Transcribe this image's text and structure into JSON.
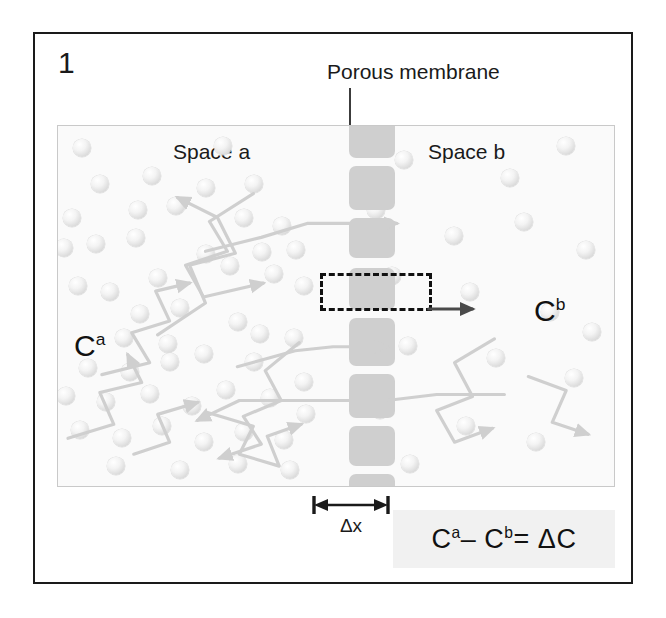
{
  "figure": {
    "panel_number": "1",
    "membrane_caption": "Porous membrane",
    "space_a_label": "Space a",
    "space_b_label": "Space b",
    "concentration_a": "C",
    "concentration_a_sup": "a",
    "concentration_b": "C",
    "concentration_b_sup": "b",
    "delta_x_label": "Δx",
    "equation": {
      "term1": "C",
      "term1_sup": "a",
      "minus": "–",
      "term2": "C",
      "term2_sup": "b",
      "equals": "=",
      "result": "ΔC"
    }
  },
  "colors": {
    "frame": "#1a1a1a",
    "panel_background": "#fafafa",
    "panel_border": "#c9c9c9",
    "membrane_block": "#cfcfcf",
    "particle": "#e4e4e4",
    "arrow_gray": "#cfcfcf",
    "arrow_dark": "#4a4a4a",
    "dashed_box": "#111111",
    "equation_box": "#f1f1f1",
    "text": "#1a1a1a"
  },
  "membrane": {
    "center_x": 291,
    "block_width": 46,
    "blocks": [
      {
        "y": -6,
        "h": 38
      },
      {
        "y": 40,
        "h": 44
      },
      {
        "y": 92,
        "h": 40
      },
      {
        "y": 142,
        "h": 42
      },
      {
        "y": 192,
        "h": 48
      },
      {
        "y": 248,
        "h": 44
      },
      {
        "y": 300,
        "h": 40
      },
      {
        "y": 348,
        "h": 44
      },
      {
        "y": 400,
        "h": 40
      },
      {
        "y": 448,
        "h": 44
      },
      {
        "y": 500,
        "h": 40
      }
    ]
  },
  "particles_a": [
    {
      "x": 24,
      "y": 22,
      "r": 9
    },
    {
      "x": 165,
      "y": 20,
      "r": 9
    },
    {
      "x": 42,
      "y": 58,
      "r": 9
    },
    {
      "x": 94,
      "y": 50,
      "r": 9
    },
    {
      "x": 148,
      "y": 62,
      "r": 9
    },
    {
      "x": 196,
      "y": 58,
      "r": 9
    },
    {
      "x": 14,
      "y": 92,
      "r": 9
    },
    {
      "x": 80,
      "y": 84,
      "r": 9
    },
    {
      "x": 118,
      "y": 80,
      "r": 9
    },
    {
      "x": 186,
      "y": 92,
      "r": 9
    },
    {
      "x": 6,
      "y": 122,
      "r": 9
    },
    {
      "x": 38,
      "y": 118,
      "r": 9
    },
    {
      "x": 78,
      "y": 112,
      "r": 9
    },
    {
      "x": 148,
      "y": 128,
      "r": 9
    },
    {
      "x": 204,
      "y": 126,
      "r": 9
    },
    {
      "x": 224,
      "y": 100,
      "r": 9
    },
    {
      "x": 20,
      "y": 160,
      "r": 9
    },
    {
      "x": 52,
      "y": 166,
      "r": 9
    },
    {
      "x": 100,
      "y": 152,
      "r": 9
    },
    {
      "x": 172,
      "y": 140,
      "r": 9
    },
    {
      "x": 216,
      "y": 148,
      "r": 9
    },
    {
      "x": 238,
      "y": 124,
      "r": 9
    },
    {
      "x": 82,
      "y": 188,
      "r": 9
    },
    {
      "x": 122,
      "y": 182,
      "r": 9
    },
    {
      "x": 180,
      "y": 196,
      "r": 9
    },
    {
      "x": 246,
      "y": 160,
      "r": 9
    },
    {
      "x": 66,
      "y": 212,
      "r": 9
    },
    {
      "x": 110,
      "y": 218,
      "r": 9
    },
    {
      "x": 202,
      "y": 208,
      "r": 9
    },
    {
      "x": 30,
      "y": 242,
      "r": 9
    },
    {
      "x": 72,
      "y": 246,
      "r": 9
    },
    {
      "x": 112,
      "y": 236,
      "r": 9
    },
    {
      "x": 146,
      "y": 228,
      "r": 9
    },
    {
      "x": 196,
      "y": 236,
      "r": 9
    },
    {
      "x": 236,
      "y": 212,
      "r": 9
    },
    {
      "x": 8,
      "y": 270,
      "r": 9
    },
    {
      "x": 48,
      "y": 276,
      "r": 9
    },
    {
      "x": 92,
      "y": 268,
      "r": 9
    },
    {
      "x": 134,
      "y": 280,
      "r": 9
    },
    {
      "x": 168,
      "y": 264,
      "r": 9
    },
    {
      "x": 212,
      "y": 272,
      "r": 9
    },
    {
      "x": 246,
      "y": 256,
      "r": 9
    },
    {
      "x": 22,
      "y": 304,
      "r": 9
    },
    {
      "x": 64,
      "y": 312,
      "r": 9
    },
    {
      "x": 104,
      "y": 300,
      "r": 9
    },
    {
      "x": 146,
      "y": 316,
      "r": 9
    },
    {
      "x": 186,
      "y": 306,
      "r": 9
    },
    {
      "x": 226,
      "y": 314,
      "r": 9
    },
    {
      "x": 248,
      "y": 288,
      "r": 9
    },
    {
      "x": 58,
      "y": 340,
      "r": 9
    },
    {
      "x": 122,
      "y": 344,
      "r": 9
    },
    {
      "x": 180,
      "y": 338,
      "r": 9
    },
    {
      "x": 232,
      "y": 344,
      "r": 9
    }
  ],
  "particles_b": [
    {
      "x": 346,
      "y": 34,
      "r": 9
    },
    {
      "x": 452,
      "y": 52,
      "r": 9
    },
    {
      "x": 508,
      "y": 20,
      "r": 9
    },
    {
      "x": 318,
      "y": 84,
      "r": 9
    },
    {
      "x": 396,
      "y": 110,
      "r": 9
    },
    {
      "x": 466,
      "y": 96,
      "r": 9
    },
    {
      "x": 528,
      "y": 124,
      "r": 9
    },
    {
      "x": 334,
      "y": 150,
      "r": 9
    },
    {
      "x": 412,
      "y": 166,
      "r": 9
    },
    {
      "x": 492,
      "y": 186,
      "r": 9
    },
    {
      "x": 350,
      "y": 220,
      "r": 9
    },
    {
      "x": 438,
      "y": 232,
      "r": 9
    },
    {
      "x": 516,
      "y": 252,
      "r": 9
    },
    {
      "x": 322,
      "y": 284,
      "r": 9
    },
    {
      "x": 408,
      "y": 300,
      "r": 9
    },
    {
      "x": 478,
      "y": 316,
      "r": 9
    },
    {
      "x": 352,
      "y": 338,
      "r": 9
    },
    {
      "x": 534,
      "y": 206,
      "r": 9
    }
  ]
}
